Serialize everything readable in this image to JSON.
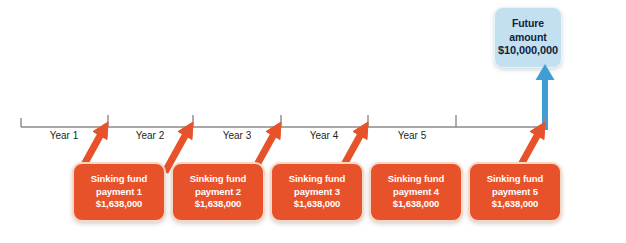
{
  "diagram": {
    "background_color": "#ffffff"
  },
  "future_amount": {
    "label_line1": "Future",
    "label_line2": "amount",
    "value": "$10,000,000",
    "box_color": "#c3e0f0",
    "text_color": "#13233c"
  },
  "arrow_up": {
    "name": "blue-up-arrow",
    "color": "#3f9fd4"
  },
  "timeline": {
    "axis_color": "#8a8a8a",
    "years": [
      {
        "label": "Year 1",
        "center_x": 64
      },
      {
        "label": "Year 2",
        "center_x": 150
      },
      {
        "label": "Year 3",
        "center_x": 237
      },
      {
        "label": "Year 4",
        "center_x": 324
      },
      {
        "label": "Year 5",
        "center_x": 412
      }
    ],
    "tick_positions": [
      21,
      108,
      193,
      281,
      368,
      456,
      545
    ]
  },
  "payments": [
    {
      "line1": "Sinking fund",
      "line2": "payment 1",
      "amount": "$1,638,000",
      "left": 72
    },
    {
      "line1": "Sinking fund",
      "line2": "payment 2",
      "amount": "$1,638,000",
      "left": 171
    },
    {
      "line1": "Sinking fund",
      "line2": "payment 3",
      "amount": "$1,638,000",
      "left": 270
    },
    {
      "line1": "Sinking fund",
      "line2": "payment 4",
      "amount": "$1,638,000",
      "left": 369
    },
    {
      "line1": "Sinking fund",
      "line2": "payment 5",
      "amount": "$1,638,000",
      "left": 468
    }
  ],
  "payment_arrows": {
    "name": "orange-diagonal-arrow",
    "color": "#e8522a",
    "count": 5
  },
  "colors": {
    "orange": "#e8522a",
    "orange_border": "#f6d8c6",
    "blue": "#c3e0f0",
    "blue_arrow": "#3f9fd4",
    "axis": "#8a8a8a"
  }
}
